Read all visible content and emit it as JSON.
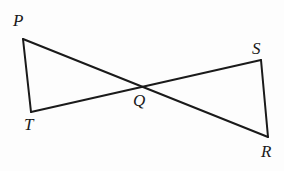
{
  "figure": {
    "type": "geometry-diagram",
    "background_color": "#fdfdfd",
    "stroke_color": "#1a1a1a",
    "stroke_width": 2,
    "points": {
      "P": {
        "label": "P",
        "x": 23,
        "y": 39
      },
      "T": {
        "label": "T",
        "x": 31,
        "y": 112
      },
      "Q": {
        "label": "Q",
        "x": 143,
        "y": 87
      },
      "S": {
        "label": "S",
        "x": 261,
        "y": 60
      },
      "R": {
        "label": "R",
        "x": 268,
        "y": 137
      }
    },
    "segments": [
      {
        "name": "PT",
        "from": "P",
        "to": "T"
      },
      {
        "name": "PR",
        "from": "P",
        "to": "R"
      },
      {
        "name": "TS",
        "from": "T",
        "to": "S"
      },
      {
        "name": "SR",
        "from": "S",
        "to": "R"
      }
    ],
    "labels": [
      {
        "id": "P",
        "text": "P"
      },
      {
        "id": "T",
        "text": "T"
      },
      {
        "id": "Q",
        "text": "Q"
      },
      {
        "id": "S",
        "text": "S"
      },
      {
        "id": "R",
        "text": "R"
      }
    ]
  }
}
